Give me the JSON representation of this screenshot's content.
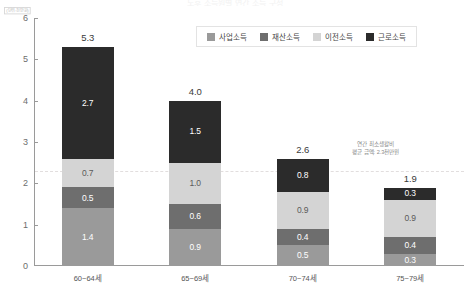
{
  "chart_data": {
    "type": "bar",
    "stacked": true,
    "title": "노후 소득원별 연간 소득 구성",
    "xlabel": "",
    "ylabel": "",
    "axis_unit": "(단위:천만원)",
    "ylim": [
      0,
      6
    ],
    "yticks": [
      "0",
      "1",
      "2",
      "3",
      "4",
      "5",
      "6"
    ],
    "grid": false,
    "legend_position": "top-right",
    "categories": [
      "60~64세",
      "65~69세",
      "70~74세",
      "75~79세"
    ],
    "totals": [
      "5.3",
      "4.0",
      "2.6",
      "1.9"
    ],
    "series": [
      {
        "name": "사업소득",
        "color": "#9a9a9a",
        "label_color": "#ffffff",
        "values": [
          1.4,
          0.9,
          0.5,
          0.3
        ],
        "labels": [
          "1.4",
          "0.9",
          "0.5",
          "0.3"
        ]
      },
      {
        "name": "재산소득",
        "color": "#6e6e6e",
        "label_color": "#ffffff",
        "values": [
          0.5,
          0.6,
          0.4,
          0.4
        ],
        "labels": [
          "0.5",
          "0.6",
          "0.4",
          "0.4"
        ]
      },
      {
        "name": "이전소득",
        "color": "#d4d4d4",
        "label_color": "#5a5a5a",
        "values": [
          0.7,
          1.0,
          0.9,
          0.9
        ],
        "labels": [
          "0.7",
          "1.0",
          "0.9",
          "0.9"
        ]
      },
      {
        "name": "근로소득",
        "color": "#2b2b2b",
        "label_color": "#ffffff",
        "values": [
          2.7,
          1.5,
          0.8,
          0.3
        ],
        "labels": [
          "2.7",
          "1.5",
          "0.8",
          "0.3"
        ]
      }
    ],
    "reference_line": {
      "value": 2.3,
      "color": "#e2dede",
      "style": "dashed",
      "note_line1": "연간 최소생활비",
      "note_line2": "평균 금액: 2.3천만원"
    }
  }
}
